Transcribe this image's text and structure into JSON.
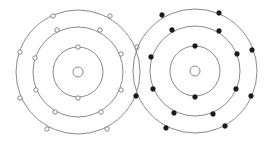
{
  "diagram": {
    "type": "bohr-model-covalent-bond",
    "colors": {
      "shell": "#8a8a8a",
      "hollow_electron": "#ffffff",
      "filled_electron": "#1a1a1a"
    },
    "atoms": [
      {
        "name": "left-atom",
        "electron_style": "hollow",
        "nucleus": {
          "cx": 78,
          "cy": 72,
          "r": 5
        },
        "shells": [
          25,
          45,
          62
        ],
        "electrons": [
          [
            78,
            47
          ],
          [
            78,
            98
          ],
          [
            57,
            30
          ],
          [
            100,
            30
          ],
          [
            35,
            58
          ],
          [
            121,
            54
          ],
          [
            36,
            90
          ],
          [
            121,
            90
          ],
          [
            55,
            112
          ],
          [
            101,
            112
          ],
          [
            53,
            16
          ],
          [
            110,
            16
          ],
          [
            20,
            52
          ],
          [
            20,
            98
          ],
          [
            47,
            129
          ],
          [
            107,
            129
          ],
          [
            137,
            47
          ]
        ]
      },
      {
        "name": "right-atom",
        "electron_style": "filled",
        "nucleus": {
          "cx": 195,
          "cy": 71,
          "r": 5
        },
        "shells": [
          25,
          45,
          62
        ],
        "electrons": [
          [
            195,
            46
          ],
          [
            195,
            97
          ],
          [
            172,
            30
          ],
          [
            219,
            31
          ],
          [
            151,
            57
          ],
          [
            237,
            54
          ],
          [
            153,
            89
          ],
          [
            236,
            89
          ],
          [
            174,
            113
          ],
          [
            213,
            114
          ],
          [
            162,
            15
          ],
          [
            219,
            13
          ],
          [
            252,
            50
          ],
          [
            251,
            96
          ],
          [
            166,
            128
          ],
          [
            225,
            126
          ],
          [
            136,
            96
          ]
        ]
      }
    ]
  }
}
